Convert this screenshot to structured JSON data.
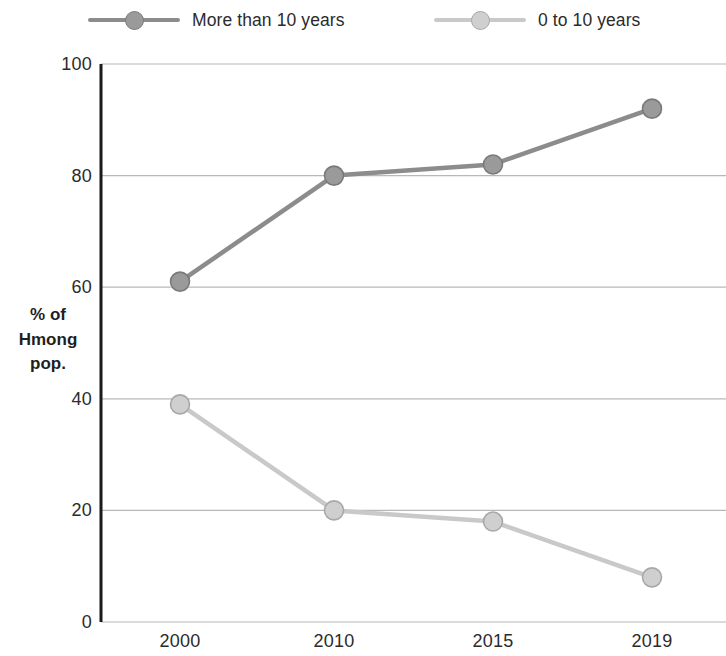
{
  "chart_data": {
    "type": "line",
    "title": "",
    "subtitle": "",
    "xlabel": "",
    "ylabel": "% of Hmong pop.",
    "ylabel_lines": [
      "% of",
      "Hmong",
      "pop."
    ],
    "categories": [
      "2000",
      "2010",
      "2015",
      "2019"
    ],
    "series": [
      {
        "name": "More than 10 years",
        "values": [
          61,
          80,
          82,
          92
        ],
        "color": "#8c8c8c",
        "marker_fill": "#9a9a9a",
        "marker_stroke": "#7a7a7a"
      },
      {
        "name": "0 to 10 years",
        "values": [
          39,
          20,
          18,
          8
        ],
        "color": "#c9c9c9",
        "marker_fill": "#cfcfcf",
        "marker_stroke": "#a8a8a8"
      }
    ],
    "ylim": [
      0,
      100
    ],
    "y_ticks": [
      0,
      20,
      40,
      60,
      80,
      100
    ],
    "y_tick_labels": [
      "0",
      "20",
      "40",
      "60",
      "80",
      "100"
    ],
    "grid": true,
    "grid_color": "#b8b8b8",
    "axis_color": "#1a1a1a",
    "legend_position": "top",
    "background": "#ffffff"
  },
  "legend": {
    "entries": [
      {
        "label": "More than 10 years"
      },
      {
        "label": "0 to 10 years"
      }
    ]
  }
}
